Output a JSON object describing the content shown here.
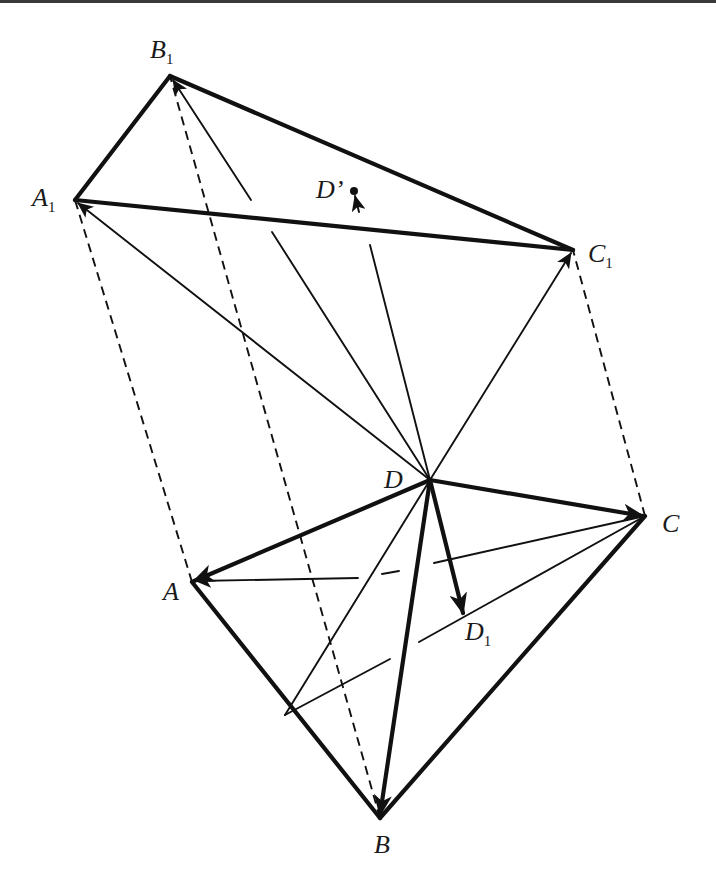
{
  "figure": {
    "points": {
      "A": {
        "label": "A",
        "sub": "",
        "x": 192,
        "y": 582
      },
      "B": {
        "label": "B",
        "sub": "",
        "x": 380,
        "y": 818
      },
      "C": {
        "label": "C",
        "sub": "",
        "x": 645,
        "y": 516
      },
      "D": {
        "label": "D",
        "sub": "",
        "x": 430,
        "y": 480
      },
      "D1": {
        "label": "D",
        "sub": "1",
        "x": 463,
        "y": 614
      },
      "A1": {
        "label": "A",
        "sub": "1",
        "x": 75,
        "y": 200
      },
      "B1": {
        "label": "B",
        "sub": "1",
        "x": 170,
        "y": 76
      },
      "C1": {
        "label": "C",
        "sub": "1",
        "x": 573,
        "y": 250
      },
      "Dp": {
        "label": "D’",
        "sub": "",
        "x": 355,
        "y": 192
      }
    },
    "labels": {
      "A": "A",
      "B": "B",
      "C": "C",
      "D": "D",
      "D1_main": "D",
      "D1_sub": "1",
      "A1_main": "A",
      "A1_sub": "1",
      "B1_main": "B",
      "B1_sub": "1",
      "C1_main": "C",
      "C1_sub": "1",
      "Dprime": "D’"
    },
    "line_styles": {
      "thick": "edges of triangles and vectors DA, DB, DC, DD1",
      "thin": "vectors DA1, DB1, DC1, DD' and inner construction lines",
      "dashed": "translation lines AA1, BB1, CC1"
    },
    "colors": {
      "ink": "#111111",
      "background": "#ffffff",
      "top_rule": "#3a3a3a"
    }
  }
}
